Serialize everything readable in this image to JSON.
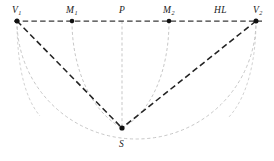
{
  "figure": {
    "canvas": {
      "width": 274,
      "height": 161,
      "background": "#ffffff"
    },
    "colors": {
      "horizon_line": "#3a3a3a",
      "ray_line": "#232323",
      "arc_line": "#b9b9b9",
      "vertical_line": "#b9b9b9",
      "point_marker": "#111111",
      "label_text": "#1a1a1a"
    },
    "labels": {
      "v1": {
        "text": "V",
        "sub": "1",
        "x": 12,
        "y": 6
      },
      "m1": {
        "text": "M",
        "sub": "1",
        "x": 66,
        "y": 6
      },
      "p": {
        "text": "P",
        "sub": "",
        "x": 119,
        "y": 6
      },
      "m2": {
        "text": "M",
        "sub": "2",
        "x": 163,
        "y": 6
      },
      "v2": {
        "text": "V",
        "sub": "2",
        "x": 253,
        "y": 6
      },
      "hl": {
        "text": "HL",
        "x": 214,
        "y": 6
      },
      "s": {
        "text": "S",
        "sub": "",
        "x": 119,
        "y": 140
      }
    },
    "points": [
      {
        "name": "V1",
        "x": 17,
        "y": 21
      },
      {
        "name": "M1",
        "x": 72,
        "y": 21
      },
      {
        "name": "P",
        "x": 122,
        "y": 21
      },
      {
        "name": "M2",
        "x": 169,
        "y": 21
      },
      {
        "name": "V2",
        "x": 256,
        "y": 21
      },
      {
        "name": "S",
        "x": 122,
        "y": 128
      }
    ],
    "horizon": {
      "x1": 14,
      "x2": 262,
      "y": 21
    },
    "rays": [
      {
        "name": "V1-S",
        "x1": 17,
        "y1": 21,
        "x2": 122,
        "y2": 128
      },
      {
        "name": "V2-S",
        "x1": 256,
        "y1": 21,
        "x2": 122,
        "y2": 128
      }
    ],
    "vertical": {
      "x": 122,
      "y1": 21,
      "y2": 128
    },
    "arcs": [
      {
        "name": "main-semicircle",
        "cx": 136.5,
        "cy": 21,
        "rx": 119.5,
        "ry": 118
      },
      {
        "name": "arc-M1-S",
        "cx": 122,
        "cy": 21,
        "rx": 50,
        "ry": 107
      },
      {
        "name": "arc-M2-S",
        "cx": 122,
        "cy": 21,
        "rx": 47,
        "ry": 107
      }
    ]
  }
}
